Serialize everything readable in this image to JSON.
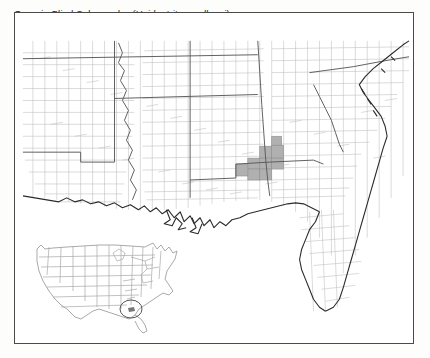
{
  "figure": {
    "title_common": "Georgia Blind Salamander",
    "title_scientific": "(Haideotriton wallacei)",
    "type": "species-distribution-map",
    "background_color": "#fdfdfc",
    "frame_color": "#4a4a4a",
    "map_background": "#ffffff"
  },
  "map": {
    "name": "southeastern-united-states-county-map",
    "region_label": "Southeastern United States",
    "county_line_color": "#b9b9b9",
    "state_line_color": "#5a5a5a",
    "coastline_color": "#2a2a2a",
    "range_fill_color": "#b0b0b0",
    "range_outline_color": "#8a8a8a",
    "states_shown": [
      "Arkansas",
      "Louisiana",
      "Mississippi",
      "Alabama",
      "Tennessee",
      "Georgia",
      "Florida",
      "South Carolina",
      "North Carolina"
    ]
  },
  "range": {
    "label": "Known range (shaded counties)",
    "description": "Shaded counties in southwestern Georgia and the Florida panhandle",
    "shaded_county_count": 9
  },
  "inset": {
    "name": "united-states-locator-map",
    "label": "United States locator inset",
    "outline_color": "#9a9a9a",
    "marker": {
      "name": "range-locator-circle",
      "shape": "ellipse",
      "color": "#555555"
    }
  }
}
